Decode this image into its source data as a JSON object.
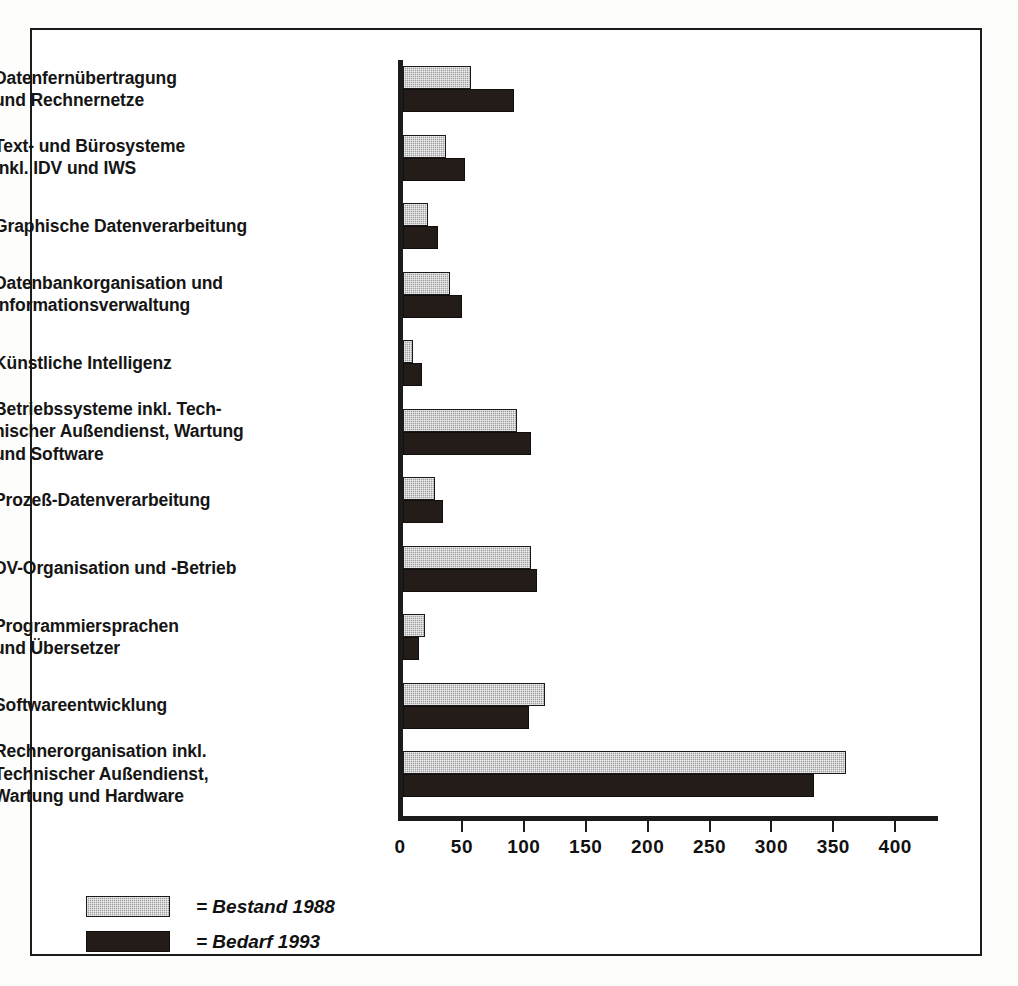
{
  "chart_data": {
    "type": "bar",
    "orientation": "horizontal",
    "title": "",
    "xlabel": "",
    "ylabel": "",
    "xlim": [
      0,
      440
    ],
    "grid": false,
    "legend_position": "bottom-left",
    "tick_labels": [
      "0",
      "50",
      "100",
      "150",
      "200",
      "250",
      "300",
      "350",
      "400"
    ],
    "ticks": [
      0,
      50,
      100,
      150,
      200,
      250,
      300,
      350,
      400
    ],
    "categories": [
      "Datenfernübertragung\nund Rechnernetze",
      "Text- und Bürosysteme\ninkl. IDV und IWS",
      "Graphische Datenverarbeitung",
      "Datenbankorganisation und\nInformationsverwaltung",
      "Künstliche Intelligenz",
      "Betriebssysteme inkl. Tech-\nnischer Außendienst, Wartung\nund Software",
      "Prozeß-Datenverarbeitung",
      "DV-Organisation und -Betrieb",
      "Programmiersprachen\nund Übersetzer",
      "Softwareentwicklung",
      "Rechnerorganisation inkl.\nTechnischer Außendienst,\nWartung und Hardware"
    ],
    "series": [
      {
        "name": "Bestand 1988",
        "color": "#9d9d9d",
        "values": [
          55,
          35,
          20,
          38,
          8,
          92,
          26,
          103,
          18,
          115,
          358
        ]
      },
      {
        "name": "Bedarf 1993",
        "color": "#241c18",
        "values": [
          90,
          50,
          28,
          48,
          15,
          103,
          32,
          108,
          13,
          102,
          332
        ]
      }
    ]
  },
  "legend": {
    "items": [
      {
        "label": "= Bestand 1988",
        "swatch": "bestand"
      },
      {
        "label": "= Bedarf 1993",
        "swatch": "bedarf"
      }
    ]
  },
  "labels": {
    "cat_0_line_0": "Datenfernübertragung",
    "cat_0_line_1": "und Rechnernetze",
    "cat_1_line_0": "Text- und Bürosysteme",
    "cat_1_line_1": "inkl. IDV und IWS",
    "cat_2_line_0": "Graphische Datenverarbeitung",
    "cat_3_line_0": "Datenbankorganisation und",
    "cat_3_line_1": "Informationsverwaltung",
    "cat_4_line_0": "Künstliche Intelligenz",
    "cat_5_line_0": "Betriebssysteme inkl. Tech-",
    "cat_5_line_1": "nischer Außendienst, Wartung",
    "cat_5_line_2": "und Software",
    "cat_6_line_0": "Prozeß-Datenverarbeitung",
    "cat_7_line_0": "DV-Organisation und -Betrieb",
    "cat_8_line_0": "Programmiersprachen",
    "cat_8_line_1": "und Übersetzer",
    "cat_9_line_0": "Softwareentwicklung",
    "cat_10_line_0": "Rechnerorganisation inkl.",
    "cat_10_line_1": "Technischer Außendienst,",
    "cat_10_line_2": "Wartung und Hardware"
  }
}
